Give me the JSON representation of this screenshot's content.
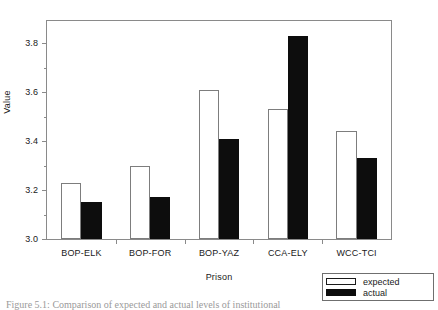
{
  "chart_data": {
    "type": "bar",
    "title": "",
    "xlabel": "Prison",
    "ylabel": "Value",
    "categories": [
      "BOP-ELK",
      "BOP-FOR",
      "BOP-YAZ",
      "CCA-ELY",
      "WCC-TCI"
    ],
    "series": [
      {
        "name": "expected",
        "color": "#ffffff",
        "values": [
          3.23,
          3.3,
          3.61,
          3.53,
          3.44
        ]
      },
      {
        "name": "actual",
        "color": "#0d0d0d",
        "values": [
          3.15,
          3.17,
          3.41,
          3.83,
          3.33
        ]
      }
    ],
    "ylim": [
      3.0,
      3.89
    ],
    "yticks": [
      3.0,
      3.2,
      3.4,
      3.6,
      3.8
    ],
    "ytick_labels": [
      "3.0",
      "3.2",
      "3.4",
      "3.6",
      "3.8"
    ],
    "yminor_ticks": [
      3.1,
      3.3,
      3.5,
      3.7
    ],
    "grid": false,
    "legend_position": "outside-bottom-right"
  },
  "legend": {
    "entries": [
      {
        "label": "expected",
        "swatch": "hollow-bar-swatch"
      },
      {
        "label": "actual",
        "swatch": "filled-bar-swatch"
      }
    ]
  },
  "caption": {
    "text": "Figure 5.1:  Comparison of expected and actual levels of institutional"
  }
}
